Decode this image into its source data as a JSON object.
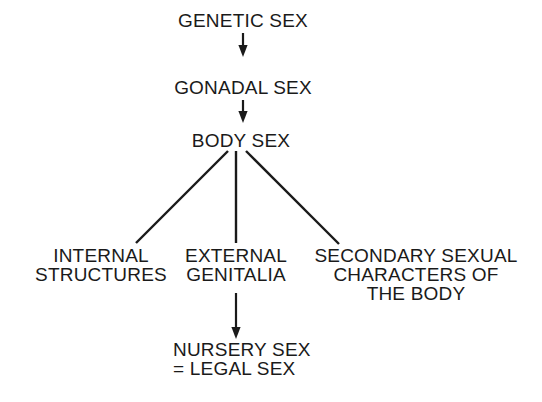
{
  "diagram": {
    "type": "flowchart",
    "background_color": "#ffffff",
    "ink_color": "#1a1a1a",
    "nodes": [
      {
        "id": "genetic_sex",
        "label": "GENETIC SEX",
        "lines": [
          "GENETIC SEX"
        ],
        "align": "center",
        "x": 243,
        "y": 27
      },
      {
        "id": "gonadal_sex",
        "label": "GONADAL SEX",
        "lines": [
          "GONADAL SEX"
        ],
        "align": "center",
        "x": 243,
        "y": 94
      },
      {
        "id": "body_sex",
        "label": "BODY SEX",
        "lines": [
          "BODY SEX"
        ],
        "align": "center",
        "x": 241,
        "y": 147
      },
      {
        "id": "internal_structures",
        "label": "INTERNAL STRUCTURES",
        "lines": [
          "INTERNAL",
          "STRUCTURES"
        ],
        "align": "center",
        "x": 101,
        "y": 262
      },
      {
        "id": "external_genitalia",
        "label": "EXTERNAL GENITALIA",
        "lines": [
          "EXTERNAL",
          "GENITALIA"
        ],
        "align": "center",
        "x": 236,
        "y": 262
      },
      {
        "id": "secondary_sexual_characters",
        "label": "SECONDARY SEXUAL CHARACTERS OF THE BODY",
        "lines": [
          "SECONDARY SEXUAL",
          "CHARACTERS OF",
          "THE BODY"
        ],
        "align": "center",
        "x": 416,
        "y": 262
      },
      {
        "id": "nursery_sex",
        "label": "NURSERY SEX = LEGAL SEX",
        "lines": [
          "NURSERY SEX",
          "= LEGAL SEX"
        ],
        "align": "left",
        "x": 173,
        "y": 356
      }
    ],
    "edges": [
      {
        "id": "genetic-to-gonadal",
        "from": "genetic_sex",
        "to": "gonadal_sex",
        "style": "arrow"
      },
      {
        "id": "gonadal-to-body",
        "from": "gonadal_sex",
        "to": "body_sex",
        "style": "arrow"
      },
      {
        "id": "body-to-internal",
        "from": "body_sex",
        "to": "internal_structures",
        "style": "line"
      },
      {
        "id": "body-to-external",
        "from": "body_sex",
        "to": "external_genitalia",
        "style": "line"
      },
      {
        "id": "body-to-secondary",
        "from": "body_sex",
        "to": "secondary_sexual_characters",
        "style": "line"
      },
      {
        "id": "external-to-nursery",
        "from": "external_genitalia",
        "to": "nursery_sex",
        "style": "arrow"
      }
    ]
  }
}
